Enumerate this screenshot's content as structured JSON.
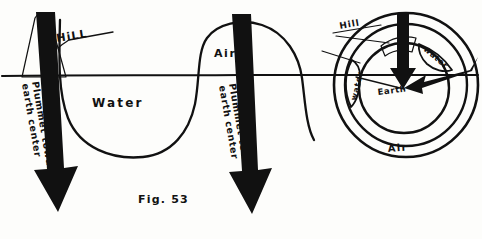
{
  "figure": {
    "caption": "Fig. 53",
    "background_color": "#fdfdfb",
    "ink_color": "#111111"
  },
  "wave_diagram": {
    "hill_label": "HiLL",
    "water_label": "Water",
    "air_label": "Air",
    "left_arrow_label_line1": "Plummet toward",
    "left_arrow_label_line2": "earth center",
    "right_arrow_label_line1": "Plummet toward",
    "right_arrow_label_line2": "earth center"
  },
  "circle_diagram": {
    "hill_label": "Hill",
    "water_label_left": "water",
    "water_label_right": "water",
    "earth_label": "Earth",
    "air_label": "Air"
  }
}
